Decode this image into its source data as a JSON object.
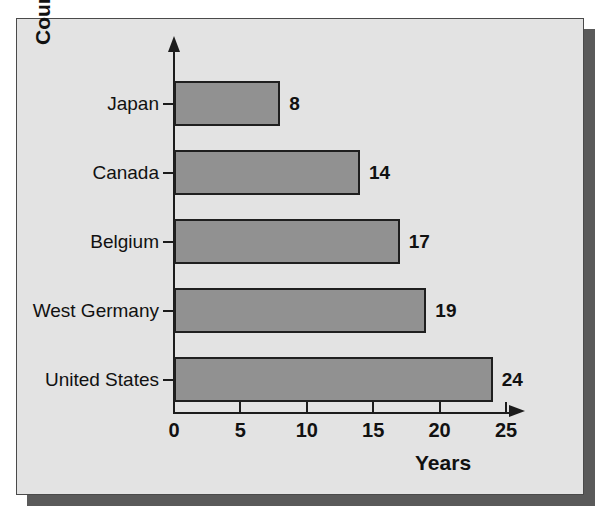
{
  "figure": {
    "background_color": "#ffffff",
    "panel_color": "#e3e3e3",
    "shadow_color": "#5a5a5a",
    "border_color": "#4a4a4a"
  },
  "chart_data": {
    "type": "bar",
    "orientation": "horizontal",
    "title": "",
    "subtitle": "",
    "xlabel": "Years",
    "ylabel": "Country",
    "categories": [
      "Japan",
      "Canada",
      "Belgium",
      "West Germany",
      "United States"
    ],
    "values": [
      8,
      14,
      17,
      19,
      24
    ],
    "value_labels": [
      "8",
      "14",
      "17",
      "19",
      "24"
    ],
    "xlim": [
      0,
      25
    ],
    "xticks": [
      0,
      5,
      10,
      15,
      20,
      25
    ],
    "xtick_labels": [
      "0",
      "5",
      "10",
      "15",
      "20",
      "25"
    ],
    "grid": false,
    "legend": false,
    "legend_position": "none",
    "bar_color": "#919191",
    "bar_edge_color": "#1f1f1f",
    "axis_color": "#1c1c1c",
    "text_color": "#111111"
  }
}
